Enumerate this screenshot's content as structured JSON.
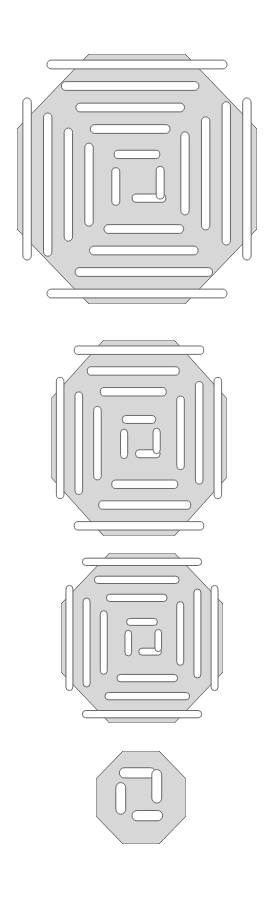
{
  "page": {
    "background_color": "#ffffff",
    "width": 274,
    "height": 902
  },
  "style": {
    "fill_color": "#d7d7d7",
    "stroke_color": "#555555",
    "stroke_width": 0.9,
    "corner_radius_label": "rounded slot ends"
  },
  "figures": [
    {
      "name": "medallion-large",
      "label": "Octagonal labyrinth medallion, 4 rings",
      "rings": 4,
      "bbox": {
        "x": 17,
        "y": 54,
        "width": 240,
        "height": 250
      },
      "size": 250,
      "corner_cut_ratio": 0.3,
      "band_count": 4
    },
    {
      "name": "medallion-medium",
      "label": "Octagonal labyrinth medallion, 3 rings",
      "rings": 3,
      "bbox": {
        "x": 51,
        "y": 340,
        "width": 176,
        "height": 196
      },
      "size": 196,
      "corner_cut_ratio": 0.3,
      "band_count": 3
    },
    {
      "name": "medallion-small",
      "label": "Octagonal labyrinth medallion, 3 rings reduced",
      "rings": 3,
      "bbox": {
        "x": 61,
        "y": 553,
        "width": 162,
        "height": 170
      },
      "size": 170,
      "corner_cut_ratio": 0.3,
      "band_count": 3
    },
    {
      "name": "medallion-tiny",
      "label": "Octagonal labyrinth medallion, core only",
      "rings": 1,
      "bbox": {
        "x": 96,
        "y": 751,
        "width": 90,
        "height": 93
      },
      "size": 93,
      "corner_cut_ratio": 0.3,
      "band_count": 1
    }
  ]
}
